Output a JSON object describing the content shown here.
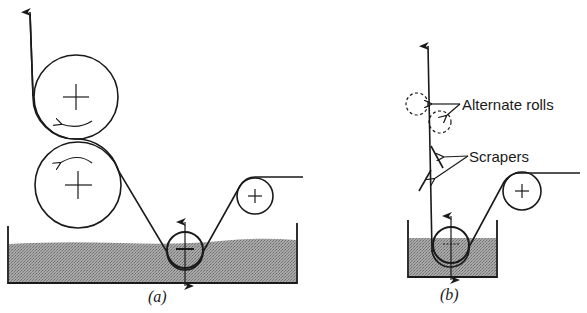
{
  "figure": {
    "panel_a": {
      "caption": "(a)",
      "components": [
        "top-roll",
        "bottom-roll",
        "dip-roll",
        "guide-roll",
        "tank",
        "web"
      ]
    },
    "panel_b": {
      "caption": "(b)",
      "labels": {
        "alternate_rolls": "Alternate rolls",
        "scrapers": "Scrapers"
      },
      "components": [
        "alternate-roll-1",
        "alternate-roll-2",
        "scraper-1",
        "scraper-2",
        "dip-roll",
        "guide-roll",
        "tank",
        "web"
      ]
    },
    "colors": {
      "line": "#1a1a1a",
      "liquid": "#9a9a9a",
      "background": "#ffffff"
    }
  }
}
